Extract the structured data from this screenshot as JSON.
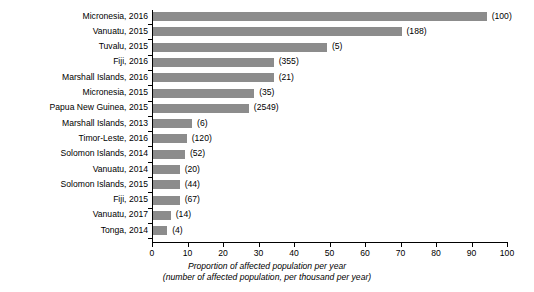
{
  "chart_data": {
    "type": "bar",
    "orientation": "horizontal",
    "title": "",
    "xlabel": "Proportion of affected population per year",
    "xlabel_sub": "(number of affected population, per thousand per year)",
    "ylabel": "",
    "xlim": [
      0,
      100
    ],
    "xticks": [
      0,
      10,
      20,
      30,
      40,
      50,
      60,
      70,
      80,
      90,
      100
    ],
    "grid": false,
    "legend": null,
    "bar_color": "#8c8c8c",
    "categories": [
      "Micronesia, 2016",
      "Vanuatu, 2015",
      "Tuvalu, 2015",
      "Fiji, 2016",
      "Marshall Islands, 2016",
      "Micronesia, 2015",
      "Papua New Guinea, 2015",
      "Marshall Islands, 2013",
      "Timor-Leste, 2016",
      "Solomon Islands, 2014",
      "Vanuatu, 2014",
      "Solomon Islands, 2015",
      "Fiji, 2015",
      "Vanuatu, 2017",
      "Tonga, 2014"
    ],
    "values": [
      94,
      70,
      49,
      34,
      34,
      28.5,
      27,
      11,
      9.5,
      9,
      7.5,
      7.5,
      7.5,
      5,
      4
    ],
    "data_labels": [
      "(100)",
      "(188)",
      "(5)",
      "(355)",
      "(21)",
      "(35)",
      "(2549)",
      "(6)",
      "(120)",
      "(52)",
      "(20)",
      "(44)",
      "(67)",
      "(14)",
      "(4)"
    ]
  }
}
